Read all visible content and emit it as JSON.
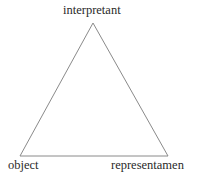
{
  "diagram": {
    "shape": "triangle",
    "stroke_color": "#8a8a8a",
    "background": "#ffffff",
    "vertices": {
      "top": {
        "label": "interpretant",
        "x": 93,
        "y": 23
      },
      "bottom_left": {
        "label": "object",
        "x": 20,
        "y": 156
      },
      "bottom_right": {
        "label": "representamen",
        "x": 168,
        "y": 156
      }
    },
    "labels": {
      "top": "interpretant",
      "bottom_left": "object",
      "bottom_right": "representamen"
    }
  }
}
